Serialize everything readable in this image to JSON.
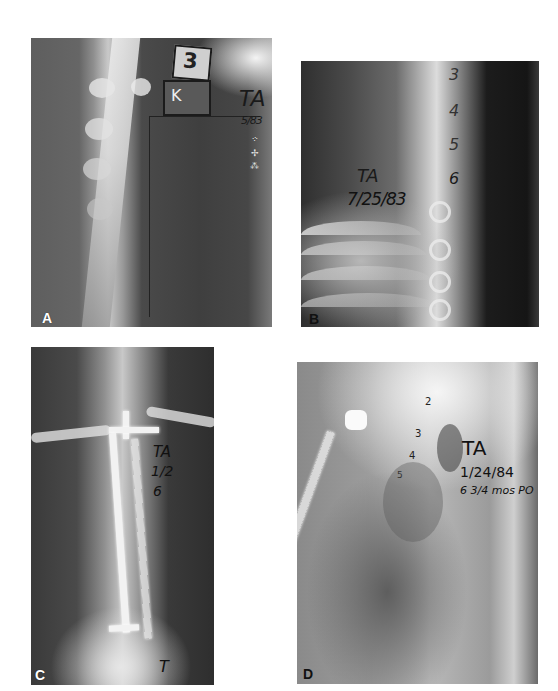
{
  "figure": {
    "panels": [
      {
        "id": "A",
        "label": "A",
        "annotations": {
          "box_top": "3",
          "box_mid": "K",
          "initials": "TA",
          "date": "5/83"
        }
      },
      {
        "id": "B",
        "label": "B",
        "annotations": {
          "vertebra_numbers": [
            "3",
            "4",
            "5",
            "6"
          ],
          "initials": "TA",
          "date": "7/25/83"
        }
      },
      {
        "id": "C",
        "label": "C",
        "annotations": {
          "initials": "TA",
          "date_partial": "1/2",
          "note_partial": "6",
          "bottom_mark": "T"
        }
      },
      {
        "id": "D",
        "label": "D",
        "annotations": {
          "vertebra_numbers": [
            "2",
            "3",
            "4",
            "5"
          ],
          "initials": "TA",
          "date": "1/24/84",
          "note": "6 3/4 mos PO"
        }
      }
    ]
  }
}
